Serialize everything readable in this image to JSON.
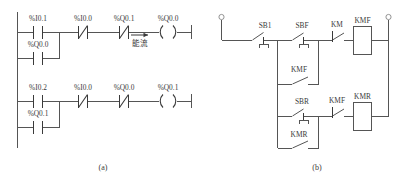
{
  "figure": {
    "caption_a": "(a)",
    "caption_b": "(b)",
    "annotation_power_flow": "能流",
    "line_color": "#555555",
    "symbol_color": "#3a3a3a",
    "background": "#ffffff"
  },
  "ladder": {
    "title": "PLC ladder diagram",
    "rungs": [
      {
        "id": "rung-1",
        "series": [
          {
            "name": "contact-i01",
            "label": "%I0.1",
            "type": "no"
          },
          {
            "name": "contact-i00",
            "label": "%I0.0",
            "type": "nc"
          },
          {
            "name": "contact-q01",
            "label": "%Q0.1",
            "type": "nc"
          }
        ],
        "branch": [
          {
            "name": "contact-q00-seal",
            "label": "%Q0.0",
            "type": "no"
          }
        ],
        "coil": {
          "name": "coil-q00",
          "label": "%Q0.0",
          "type": "coil"
        }
      },
      {
        "id": "rung-2",
        "series": [
          {
            "name": "contact-i02",
            "label": "%I0.2",
            "type": "no"
          },
          {
            "name": "contact-i00",
            "label": "%I0.0",
            "type": "nc"
          },
          {
            "name": "contact-q00",
            "label": "%Q0.0",
            "type": "nc"
          }
        ],
        "branch": [
          {
            "name": "contact-q01-seal",
            "label": "%Q0.1",
            "type": "no"
          }
        ],
        "coil": {
          "name": "coil-q01",
          "label": "%Q0.1",
          "type": "coil"
        }
      }
    ]
  },
  "relay_circuit": {
    "title": "Relay control circuit",
    "elements": [
      {
        "name": "pushbutton-sb1",
        "label": "SB1",
        "type": "pushbutton-nc"
      },
      {
        "name": "pushbutton-sbf",
        "label": "SBF",
        "type": "pushbutton-no"
      },
      {
        "name": "contact-km",
        "label": "KM",
        "type": "contact-nc"
      },
      {
        "name": "coil-kmf",
        "label": "KMF",
        "type": "coil-box"
      },
      {
        "name": "contact-kmf-seal",
        "label": "KMF",
        "type": "contact-no"
      },
      {
        "name": "pushbutton-sbr",
        "label": "SBR",
        "type": "pushbutton-no"
      },
      {
        "name": "contact-kmf-interlock",
        "label": "KMF",
        "type": "contact-nc"
      },
      {
        "name": "coil-kmr",
        "label": "KMR",
        "type": "coil-box"
      },
      {
        "name": "contact-kmr-seal",
        "label": "KMR",
        "type": "contact-no"
      }
    ],
    "labels": {
      "sb1": "SB1",
      "sbf": "SBF",
      "km": "KM",
      "kmf_coil": "KMF",
      "kmf_seal": "KMF",
      "sbr": "SBR",
      "kmf_interlock": "KMF",
      "kmr_coil": "KMR",
      "kmr_seal": "KMR"
    }
  }
}
